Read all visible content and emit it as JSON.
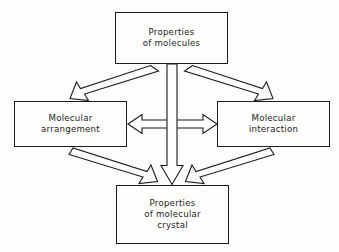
{
  "diagram": {
    "type": "block-arrow-flow-diagram",
    "background_color": "#fdfdfc",
    "line_color": "#1b1b1b",
    "nodes": [
      {
        "id": "top",
        "name": "properties-of-molecules",
        "lines": [
          "Properties",
          "of molecules"
        ],
        "position": "top-center"
      },
      {
        "id": "left",
        "name": "molecular-arrangement",
        "lines": [
          "Molecular",
          "arrangement"
        ],
        "position": "middle-left"
      },
      {
        "id": "right",
        "name": "molecular-interaction",
        "lines": [
          "Molecular",
          "interaction"
        ],
        "position": "middle-right"
      },
      {
        "id": "bottom",
        "name": "properties-of-molecular-crystal",
        "lines": [
          "Properties",
          "of molecular",
          "crystal"
        ],
        "position": "bottom-center"
      }
    ],
    "arrows": [
      {
        "id": "top-to-left",
        "from": "top",
        "to": "left",
        "style": "hollow-block",
        "heads": "single"
      },
      {
        "id": "top-to-right",
        "from": "top",
        "to": "right",
        "style": "hollow-block",
        "heads": "single"
      },
      {
        "id": "top-to-bottom",
        "from": "top",
        "to": "bottom",
        "style": "hollow-block",
        "heads": "single"
      },
      {
        "id": "left-to-bottom",
        "from": "left",
        "to": "bottom",
        "style": "hollow-block",
        "heads": "single"
      },
      {
        "id": "right-to-bottom",
        "from": "right",
        "to": "bottom",
        "style": "hollow-block",
        "heads": "single"
      },
      {
        "id": "left-right-bidirectional",
        "from": "left",
        "to": "right",
        "style": "hollow-block",
        "heads": "double"
      }
    ]
  }
}
